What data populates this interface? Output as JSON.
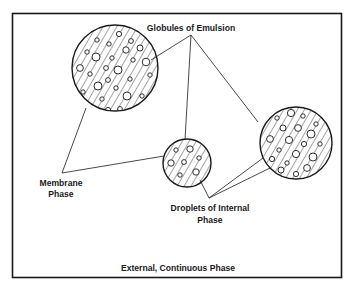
{
  "diagram": {
    "labels": {
      "globules": "Globules of Emulsion",
      "membrane_line1": "Membrane",
      "membrane_line2": "Phase",
      "droplets_line1": "Droplets of Internal",
      "droplets_line2": "Phase",
      "external": "External, Continuous Phase"
    },
    "colors": {
      "ink": "#1a1a1a",
      "background": "#ffffff"
    },
    "globules": [
      {
        "id": "globule-large-left",
        "cx": 115,
        "cy": 68,
        "r": 43
      },
      {
        "id": "globule-small-center",
        "cx": 187,
        "cy": 163,
        "r": 24
      },
      {
        "id": "globule-medium-right",
        "cx": 296,
        "cy": 143,
        "r": 36
      }
    ]
  }
}
